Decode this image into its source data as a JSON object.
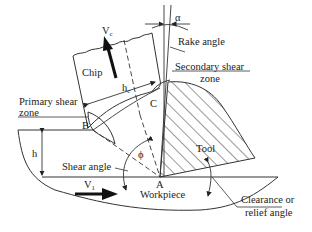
{
  "diagram": {
    "labels": {
      "chip": "Chip",
      "vc_main": "V",
      "vc_sub": "c",
      "hc_main": "h",
      "hc_sub": "c",
      "alpha": "α",
      "rake_angle": "Rake angle",
      "secondary_shear_line1": "Secondary shear",
      "secondary_shear_line2": "zone",
      "primary_shear_line1": "Primary shear",
      "primary_shear_line2": "zone",
      "point_b": "B",
      "point_c": "C",
      "point_a": "A",
      "h": "h",
      "phi": "ϕ",
      "shear_angle": "Shear angle",
      "tool": "Tool",
      "v1_main": "V",
      "v1_sub": "1",
      "workpiece": "Workpiece",
      "clearance_line1": "Clearance or",
      "clearance_line2": "relief angle"
    },
    "colors": {
      "line": "#333333",
      "text": "#222222",
      "arrow": "#111111",
      "background": "#ffffff"
    }
  }
}
